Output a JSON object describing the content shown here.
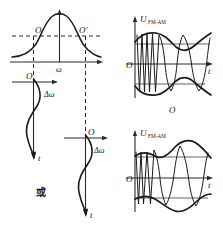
{
  "figure": {
    "background": "#ffffff",
    "ink_color": "#1a1a1a"
  },
  "panels": {
    "resonance": {
      "name": "resonance-curve-panel",
      "axis_x_label": "ω",
      "point_left_label": "O",
      "point_right_label": "O′",
      "description": "bell-shaped resonance curve with horizontal dashed level line intersecting both slopes"
    },
    "deviation_left": {
      "name": "frequency-deviation-panel-left",
      "origin_label": "O",
      "axis_x_label": "Δω",
      "axis_y_label": "t",
      "description": "S-shaped frequency deviation versus time, downward time axis"
    },
    "deviation_right": {
      "name": "frequency-deviation-panel-right",
      "origin_label": "O",
      "axis_x_label": "Δω",
      "axis_y_label": "t",
      "description": "S-shaped frequency deviation versus time, mirrored phase"
    },
    "connector": {
      "name": "or-connector",
      "label": "或"
    },
    "waveform_top": {
      "name": "fm-am-waveform-top",
      "axis_y_main": "U",
      "axis_y_subscript": "FM-AM",
      "origin_label": "O",
      "axis_x_label": "t",
      "caption": "O",
      "description": "amplitude modulated carrier with pinched waist envelope"
    },
    "waveform_bottom": {
      "name": "fm-am-waveform-bottom",
      "axis_y_main": "U",
      "axis_y_subscript": "FM-AM",
      "origin_label": "O",
      "axis_x_label": "t",
      "description": "amplitude modulated carrier with bulging envelope"
    }
  }
}
